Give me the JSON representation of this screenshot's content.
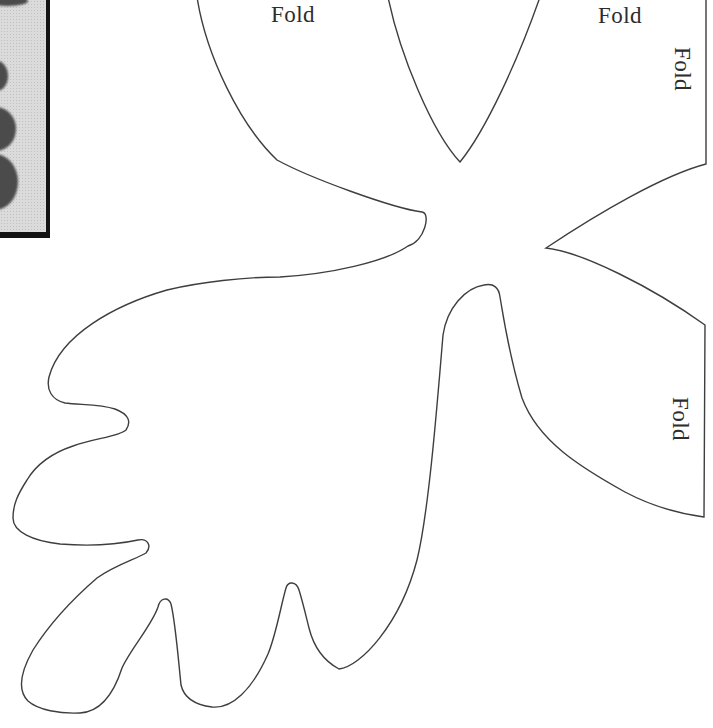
{
  "page": {
    "background_color": "#ffffff",
    "outline_color": "#3e3e3e",
    "text_color": "#2d2d2d"
  },
  "fold_labels": [
    {
      "text": "Fold",
      "orientation": "horizontal"
    },
    {
      "text": "Fold",
      "orientation": "horizontal"
    },
    {
      "text": "Fold",
      "orientation": "vertical"
    },
    {
      "text": "Fold",
      "orientation": "vertical"
    }
  ],
  "photo_thumbnail": {
    "background_color": "#dbdbdb",
    "leaf_silhouette_color": "#4b4b4b",
    "frame_color": "#141414"
  }
}
